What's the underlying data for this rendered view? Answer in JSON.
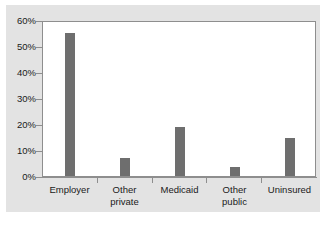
{
  "chart_data": {
    "type": "bar",
    "title": "",
    "subtitle": "",
    "xlabel": "",
    "ylabel": "",
    "categories": [
      "Employer",
      "Other private",
      "Medicaid",
      "Other public",
      "Uninsured"
    ],
    "category_lines": [
      [
        "Employer"
      ],
      [
        "Other",
        "private"
      ],
      [
        "Medicaid"
      ],
      [
        "Other",
        "public"
      ],
      [
        "Uninsured"
      ]
    ],
    "values": [
      55,
      7,
      19,
      3.5,
      14.5
    ],
    "value_labels": [
      "55%",
      "7%",
      "19%",
      "3.5%",
      "14.5%"
    ],
    "ylim": [
      0,
      60
    ],
    "ytick_values": [
      0,
      10,
      20,
      30,
      40,
      50,
      60
    ],
    "ytick_labels": [
      "0%",
      "10%",
      "20%",
      "30%",
      "40%",
      "50%",
      "60%"
    ],
    "legend": [],
    "legend_position": "none",
    "grid": false,
    "bar_color": "#6e6e6e",
    "plot_background": "#ffffff",
    "figure_background": "#e3e3e3",
    "axis_color": "#8e8e8e",
    "text_color": "#1a1a1a"
  }
}
